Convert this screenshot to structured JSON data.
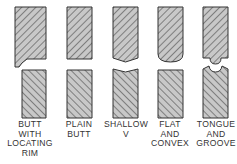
{
  "colors": {
    "outline": "#333333",
    "hatch": "#555555",
    "fill": "#c8c8c8",
    "label": "#333333"
  },
  "joints": [
    {
      "id": "butt-with-locating-rim",
      "label_lines": [
        "BUTT",
        "WITH",
        "LOCATING",
        "RIM"
      ],
      "center_x": 30
    },
    {
      "id": "plain-butt",
      "label_lines": [
        "PLAIN",
        "BUTT"
      ],
      "center_x": 79
    },
    {
      "id": "shallow-v",
      "label_lines": [
        "SHALLOW",
        "V"
      ],
      "center_x": 126
    },
    {
      "id": "flat-and-convex",
      "label_lines": [
        "FLAT",
        "AND",
        "CONVEX"
      ],
      "center_x": 170
    },
    {
      "id": "tongue-and-groove",
      "label_lines": [
        "TONGUE",
        "AND",
        "GROOVE"
      ],
      "center_x": 216
    }
  ]
}
